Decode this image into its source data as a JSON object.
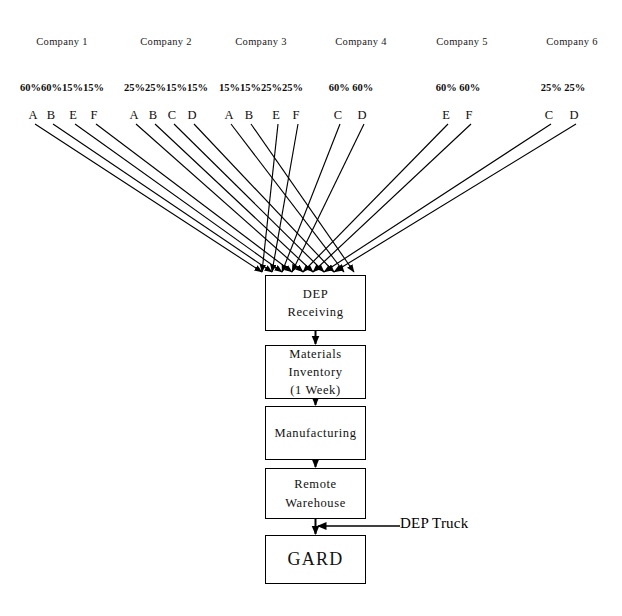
{
  "diagram": {
    "companies": [
      {
        "name": "Company 1",
        "header_x": 62,
        "percents": [
          "60%",
          "60%",
          "15%",
          "15%"
        ],
        "percents_text": "60%60%15%15%",
        "percents_x": 62,
        "sources": [
          {
            "letter": "A",
            "x": 33
          },
          {
            "letter": "B",
            "x": 51
          },
          {
            "letter": "E",
            "x": 73
          },
          {
            "letter": "F",
            "x": 94
          }
        ]
      },
      {
        "name": "Company 2",
        "header_x": 166,
        "percents": [
          "25%",
          "25%",
          "15%",
          "15%"
        ],
        "percents_text": "25%25%15%15%",
        "percents_x": 166,
        "sources": [
          {
            "letter": "A",
            "x": 134
          },
          {
            "letter": "B",
            "x": 153
          },
          {
            "letter": "C",
            "x": 172
          },
          {
            "letter": "D",
            "x": 192
          }
        ]
      },
      {
        "name": "Company 3",
        "header_x": 261,
        "percents": [
          "15%",
          "15%",
          "25%",
          "25%"
        ],
        "percents_text": "15%15%25%25%",
        "percents_x": 261,
        "sources": [
          {
            "letter": "A",
            "x": 229
          },
          {
            "letter": "B",
            "x": 249
          },
          {
            "letter": "E",
            "x": 276
          },
          {
            "letter": "F",
            "x": 296
          }
        ]
      },
      {
        "name": "Company 4",
        "header_x": 361,
        "percents": [
          "60%",
          "60%"
        ],
        "percents_text": "60% 60%",
        "percents_x": 351,
        "sources": [
          {
            "letter": "C",
            "x": 338
          },
          {
            "letter": "D",
            "x": 362
          }
        ]
      },
      {
        "name": "Company 5",
        "header_x": 462,
        "percents": [
          "60%",
          "60%"
        ],
        "percents_text": "60% 60%",
        "percents_x": 458,
        "sources": [
          {
            "letter": "E",
            "x": 446
          },
          {
            "letter": "F",
            "x": 469
          }
        ]
      },
      {
        "name": "Company 6",
        "header_x": 572,
        "percents": [
          "25%",
          "25%"
        ],
        "percents_text": "25% 25%",
        "percents_x": 563,
        "sources": [
          {
            "letter": "C",
            "x": 549
          },
          {
            "letter": "D",
            "x": 574
          }
        ]
      }
    ],
    "process_boxes": [
      {
        "id": "dep-receiving",
        "lines": [
          "DEP",
          "Receiving"
        ],
        "x": 265,
        "y": 275,
        "w": 101,
        "h": 56,
        "big": false
      },
      {
        "id": "materials-inventory",
        "lines": [
          "Materials",
          "Inventory",
          "(1 Week)"
        ],
        "x": 265,
        "y": 345,
        "w": 101,
        "h": 54,
        "big": false
      },
      {
        "id": "manufacturing",
        "lines": [
          "Manufacturing"
        ],
        "x": 265,
        "y": 406,
        "w": 101,
        "h": 54,
        "big": false
      },
      {
        "id": "remote-warehouse",
        "lines": [
          "Remote",
          "Warehouse"
        ],
        "x": 265,
        "y": 468,
        "w": 101,
        "h": 51,
        "big": false
      },
      {
        "id": "gard",
        "lines": [
          "GARD"
        ],
        "x": 265,
        "y": 535,
        "w": 101,
        "h": 49,
        "big": true
      }
    ],
    "external_input": {
      "label": "DEP Truck",
      "label_x": 400,
      "label_y": 515,
      "line_from_x": 400,
      "line_to_x": 318,
      "line_y": 526
    },
    "arrow_targets": [
      262,
      272,
      282,
      292,
      303,
      313,
      324,
      334,
      344,
      354
    ],
    "colors": {
      "stroke": "#000000",
      "text": "#111111",
      "background": "#ffffff"
    }
  }
}
